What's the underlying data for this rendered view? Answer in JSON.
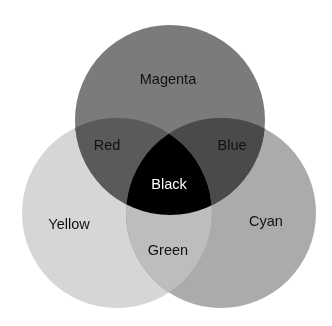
{
  "diagram": {
    "type": "venn-3",
    "circles": [
      {
        "name": "Magenta",
        "cx": 170,
        "cy": 120,
        "r": 95,
        "fill": "#7b7b7b",
        "label_x": 168,
        "label_y": 80
      },
      {
        "name": "Yellow",
        "cx": 117,
        "cy": 213,
        "r": 95,
        "fill": "#d6d6d6",
        "label_x": 69,
        "label_y": 225
      },
      {
        "name": "Cyan",
        "cx": 221,
        "cy": 213,
        "r": 95,
        "fill": "#ababab",
        "label_x": 266,
        "label_y": 222
      }
    ],
    "regions": [
      {
        "name": "Red",
        "x": 107,
        "y": 146,
        "color": "#111111"
      },
      {
        "name": "Blue",
        "x": 232,
        "y": 146,
        "color": "#111111"
      },
      {
        "name": "Black",
        "x": 169,
        "y": 185,
        "color": "#ffffff"
      },
      {
        "name": "Green",
        "x": 168,
        "y": 251,
        "color": "#111111"
      }
    ],
    "label_color": "#111111"
  }
}
